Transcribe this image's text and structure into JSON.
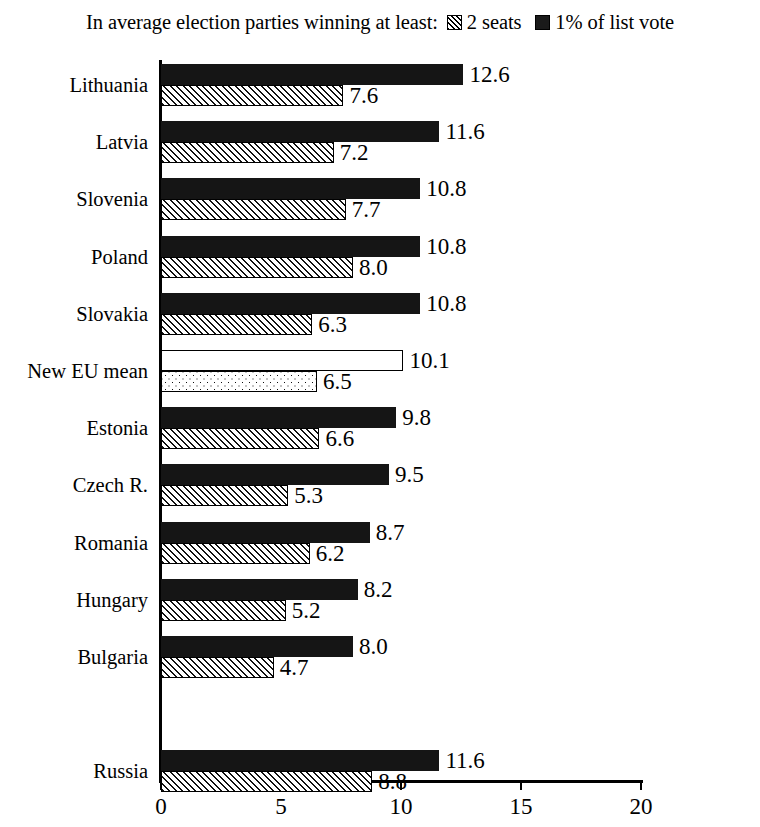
{
  "legend": {
    "title": "In average election parties winning at least:",
    "entries": [
      {
        "swatch": "hatch-square-icon",
        "label": "2 seats"
      },
      {
        "swatch": "solid-square-icon",
        "label": "1% of list vote"
      }
    ]
  },
  "axis": {
    "ticks": [
      "0",
      "5",
      "10",
      "15",
      "20"
    ]
  },
  "chart_data": {
    "type": "bar",
    "orientation": "horizontal",
    "title": "In average election parties winning at least:",
    "xlabel": "",
    "ylabel": "",
    "xlim": [
      0,
      20
    ],
    "xticks": [
      0,
      5,
      10,
      15,
      20
    ],
    "grid": false,
    "legend_position": "top",
    "categories": [
      "Lithuania",
      "Latvia",
      "Slovenia",
      "Poland",
      "Slovakia",
      "New EU mean",
      "Estonia",
      "Czech R.",
      "Romania",
      "Hungary",
      "Bulgaria",
      "Russia"
    ],
    "series": [
      {
        "name": "1% of list vote",
        "fill": "solid",
        "values": [
          12.6,
          11.6,
          10.8,
          10.8,
          10.8,
          10.1,
          9.8,
          9.5,
          8.7,
          8.2,
          8.0,
          11.6
        ],
        "labels": [
          "12.6",
          "11.6",
          "10.8",
          "10.8",
          "10.8",
          "10.1",
          "9.8",
          "9.5",
          "8.7",
          "8.2",
          "8.0",
          "11.6"
        ]
      },
      {
        "name": "2 seats",
        "fill": "hatch",
        "values": [
          7.6,
          7.2,
          7.7,
          8.0,
          6.3,
          6.5,
          6.6,
          5.3,
          6.2,
          5.2,
          4.7,
          8.8
        ],
        "labels": [
          "7.6",
          "7.2",
          "7.7",
          "8.0",
          "6.3",
          "6.5",
          "6.6",
          "5.3",
          "6.2",
          "5.2",
          "4.7",
          "8.8"
        ]
      }
    ],
    "highlight_category": "New EU mean",
    "highlight_fills": {
      "1% of list vote": "open",
      "2 seats": "dotted"
    },
    "separated_category": "Russia"
  }
}
